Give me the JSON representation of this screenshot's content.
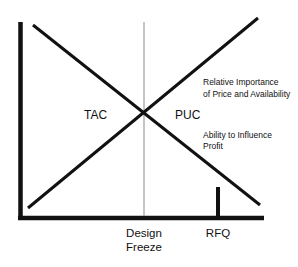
{
  "diagram": {
    "colors": {
      "background": "#ffffff",
      "lines": "#111111",
      "design_freeze_line": "#8a8a8a",
      "text": "#111111"
    },
    "axes": {
      "y_axis": {
        "x": 20.5,
        "y1": 22,
        "y2": 220
      },
      "x_axis": {
        "y": 218,
        "x1": 18,
        "x2": 264
      }
    },
    "curves": [
      {
        "name": "Ability to Influence Profit",
        "direction": "declining",
        "x1": 33,
        "y1": 25,
        "x2": 260,
        "y2": 205
      },
      {
        "name": "Relative Importance of Price and Availability",
        "direction": "rising",
        "x1": 28,
        "y1": 208,
        "x2": 258,
        "y2": 18
      }
    ],
    "markers": {
      "design_freeze": {
        "x": 144,
        "y1": 22,
        "y2": 216
      },
      "rfq": {
        "x": 218,
        "y1": 187,
        "y2": 216
      }
    },
    "labels": {
      "tac": "TAC",
      "puc": "PUC",
      "relative_importance_line1": "Relative Importance",
      "relative_importance_line2": "of Price and Availability",
      "ability_line1": "Ability to Influence",
      "ability_line2": "Profit",
      "design_freeze_line1": "Design",
      "design_freeze_line2": "Freeze",
      "rfq": "RFQ"
    }
  }
}
